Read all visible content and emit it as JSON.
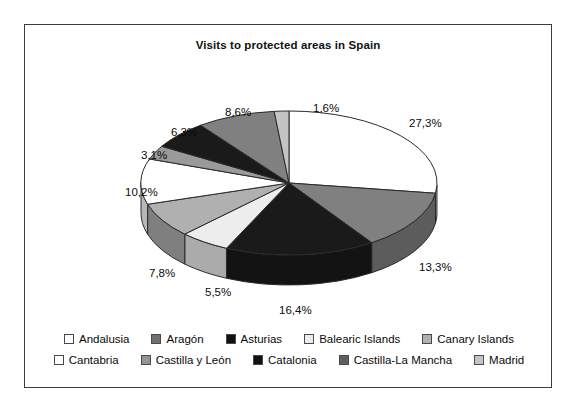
{
  "chart_data": {
    "type": "pie",
    "title": "Visits to protected areas in Spain",
    "xlabel": "",
    "ylabel": "",
    "legend_position": "bottom",
    "three_d": true,
    "categories": [
      "Andalusia",
      "Aragón",
      "Asturias",
      "Balearic Islands",
      "Canary Islands",
      "Cantabria",
      "Castilla y León",
      "Catalonia",
      "Castilla-La Mancha",
      "Madrid"
    ],
    "values": [
      27.3,
      13.3,
      16.4,
      5.5,
      7.8,
      10.2,
      3.1,
      6.3,
      8.6,
      1.6
    ],
    "value_labels": [
      "27,3%",
      "13,3%",
      "16,4%",
      "5,5%",
      "7,8%",
      "10,2%",
      "3,1%",
      "6,3%",
      "8,6%",
      "1,6%"
    ],
    "slice_colors": [
      "#ffffff",
      "#808080",
      "#1a1a1a",
      "#ededed",
      "#b0b0b0",
      "#ffffff",
      "#9a9a9a",
      "#1a1a1a",
      "#808080",
      "#c4c4c4"
    ]
  },
  "title": "Visits to protected areas in Spain",
  "labels": {
    "andalusia_pct": "27,3%",
    "aragon_pct": "13,3%",
    "asturias_pct": "16,4%",
    "balearic_pct": "5,5%",
    "canary_pct": "7,8%",
    "cantabria_pct": "10,2%",
    "castilla_leon_pct": "3,1%",
    "catalonia_pct": "6,3%",
    "castilla_mancha_pct": "8,6%",
    "madrid_pct": "1,6%"
  },
  "legend": {
    "row1": [
      {
        "label": "Andalusia",
        "color": "#ffffff"
      },
      {
        "label": "Aragón",
        "color": "#707070"
      },
      {
        "label": "Asturias",
        "color": "#111111"
      },
      {
        "label": "Balearic Islands",
        "color": "#ededed"
      },
      {
        "label": "Canary Islands",
        "color": "#b0b0b0"
      }
    ],
    "row2": [
      {
        "label": "Cantabria",
        "color": "#ffffff"
      },
      {
        "label": "Castilla y León",
        "color": "#949494"
      },
      {
        "label": "Catalonia",
        "color": "#111111"
      },
      {
        "label": "Castilla-La Mancha",
        "color": "#5e5e5e"
      },
      {
        "label": "Madrid",
        "color": "#c4c4c4"
      }
    ]
  }
}
